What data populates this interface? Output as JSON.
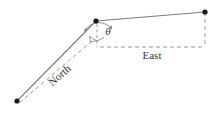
{
  "figure": {
    "type": "vector-diagram",
    "title": "",
    "background_color": "#ffffff",
    "line_color": "#808080",
    "dash_color": "#9a9a9a",
    "point_color": "#1a1a1a",
    "text_color": "#3a3a3a",
    "width": 221,
    "height": 115
  },
  "labels": {
    "north": "North",
    "east": "East",
    "theta": "θ"
  },
  "points": [
    {
      "name": "vertex",
      "x": 96,
      "y": 21
    },
    {
      "name": "east-endpoint",
      "x": 205,
      "y": 12
    },
    {
      "name": "north-endpoint",
      "x": 17,
      "y": 101
    }
  ],
  "segments": [
    {
      "name": "vertex-to-east-endpoint",
      "style": "solid",
      "from": "vertex",
      "to": "east-endpoint"
    },
    {
      "name": "vertex-to-north-endpoint",
      "style": "solid",
      "from": "vertex",
      "to": "north-endpoint"
    }
  ],
  "dashed_lines": [
    {
      "name": "east-reference-line",
      "x1": 100,
      "y1": 47,
      "x2": 205,
      "y2": 47
    },
    {
      "name": "east-endpoint-drop-line",
      "x1": 205,
      "y1": 12,
      "x2": 205,
      "y2": 47
    },
    {
      "name": "vertical-reference-line",
      "x1": 97,
      "y1": 23,
      "x2": 97,
      "y2": 47
    },
    {
      "name": "north-reference-line",
      "x1": 92,
      "y1": 41,
      "x2": 18,
      "y2": 104
    }
  ],
  "markers": {
    "angle_arc": {
      "name": "theta-arc",
      "center": "vertex",
      "radius": 16
    },
    "right_angle": {
      "name": "right-angle-marker",
      "x": 97,
      "y": 41
    }
  },
  "label_positions": {
    "north": {
      "x": 62,
      "y": 78,
      "rotation": -41
    },
    "east": {
      "x": 152,
      "y": 59,
      "rotation": 0
    },
    "theta": {
      "x": 108,
      "y": 35,
      "rotation": 0
    }
  }
}
